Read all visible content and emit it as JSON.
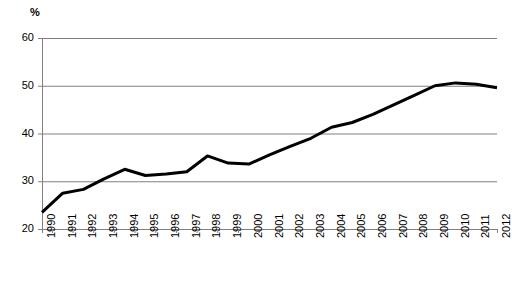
{
  "chart_data": {
    "type": "line",
    "title": "",
    "subtitle": "",
    "unit_label": "%",
    "xlabel": "",
    "ylabel": "",
    "ylim": [
      20,
      60
    ],
    "y_ticks": [
      20,
      30,
      40,
      50,
      60
    ],
    "grid": "horizontal",
    "legend": "none",
    "categories": [
      "1990",
      "1991",
      "1992",
      "1993",
      "1994",
      "1995",
      "1996",
      "1997",
      "1998",
      "1999",
      "2000",
      "2001",
      "2002",
      "2003",
      "2004",
      "2005",
      "2006",
      "2007",
      "2008",
      "2009",
      "2010",
      "2011",
      "2012"
    ],
    "values": [
      23.5,
      27.5,
      28.3,
      30.5,
      32.5,
      31.2,
      31.5,
      32.0,
      35.3,
      33.8,
      33.6,
      35.5,
      37.3,
      39.0,
      41.3,
      42.3,
      44.0,
      46.0,
      48.0,
      50.0,
      50.6,
      50.3,
      49.6
    ],
    "series": [
      {
        "name": "",
        "color": "#000000",
        "values": [
          23.5,
          27.5,
          28.3,
          30.5,
          32.5,
          31.2,
          31.5,
          32.0,
          35.3,
          33.8,
          33.6,
          35.5,
          37.3,
          39.0,
          41.3,
          42.3,
          44.0,
          46.0,
          48.0,
          50.0,
          50.6,
          50.3,
          49.6
        ]
      }
    ],
    "colors": {
      "line": "#000000",
      "gridline": "#808080",
      "axis": "#808080",
      "text": "#000000",
      "background": "#ffffff"
    }
  }
}
